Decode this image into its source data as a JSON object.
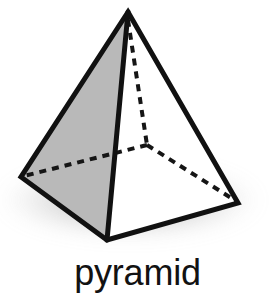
{
  "figure": {
    "label": "pyramid",
    "kind": "square-pyramid-line-drawing",
    "background_color": "#ffffff",
    "outline_color": "#111111",
    "shaded_face_color": "#b9b9b9",
    "lit_face_color": "#ffffff",
    "hidden_edge_color": "#151515",
    "shadow_color": "#9a9a9a",
    "outline_width_px": 5,
    "hidden_edge_width_px": 4,
    "hidden_edge_dash": "7 6",
    "vertices": {
      "apex": {
        "x": 128,
        "y": 12
      },
      "base_left": {
        "x": 21,
        "y": 177
      },
      "base_front": {
        "x": 107,
        "y": 240
      },
      "base_right": {
        "x": 238,
        "y": 203
      },
      "base_back_hidden": {
        "x": 147,
        "y": 145
      }
    },
    "faces": [
      {
        "name": "left-face",
        "fill": "#b9b9b9",
        "visible": true,
        "vertices": [
          "apex",
          "base_left",
          "base_front"
        ]
      },
      {
        "name": "right-face",
        "fill": "#ffffff",
        "visible": true,
        "vertices": [
          "apex",
          "base_front",
          "base_right"
        ]
      }
    ],
    "visible_edges": [
      {
        "name": "edge-apex-left",
        "from": "apex",
        "to": "base_left"
      },
      {
        "name": "edge-apex-front",
        "from": "apex",
        "to": "base_front"
      },
      {
        "name": "edge-apex-right",
        "from": "apex",
        "to": "base_right"
      },
      {
        "name": "edge-base-left-front",
        "from": "base_left",
        "to": "base_front"
      },
      {
        "name": "edge-base-front-right",
        "from": "base_front",
        "to": "base_right"
      }
    ],
    "hidden_edges": [
      {
        "name": "hidden-edge-apex-back",
        "from": "apex",
        "to": "base_back_hidden"
      },
      {
        "name": "hidden-edge-back-left",
        "from": "base_back_hidden",
        "to": "base_left"
      },
      {
        "name": "hidden-edge-back-right",
        "from": "base_back_hidden",
        "to": "base_right"
      }
    ],
    "shadow": {
      "name": "ground-shadow",
      "center_x": 130,
      "center_y": 200,
      "radius_x": 132,
      "radius_y": 40,
      "blur_px": 9,
      "opacity": 0.62
    },
    "caption": {
      "text": "pyramid",
      "font_size_px": 36,
      "color": "#121212",
      "align": "center",
      "top_px": 248
    }
  }
}
